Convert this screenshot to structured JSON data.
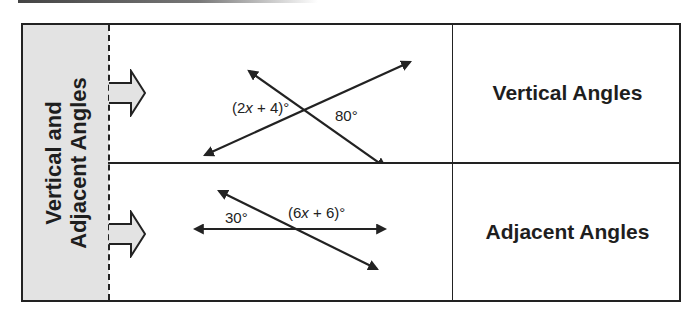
{
  "side_panel": {
    "line1": "Vertical and",
    "line2": "Adjacent Angles",
    "fill": "#e3e3e3"
  },
  "rows": [
    {
      "figure": {
        "left_label": "(2x + 4)°",
        "left_label_parts": [
          "(2",
          "x",
          " + 4)°"
        ],
        "right_label": "80°"
      },
      "term": "Vertical Angles"
    },
    {
      "figure": {
        "left_label": "30°",
        "right_label": "(6x + 6)°",
        "right_label_parts": [
          "(6",
          "x",
          " + 6)°"
        ]
      },
      "term": "Adjacent Angles"
    }
  ],
  "colors": {
    "line": "#222222",
    "background": "#ffffff"
  }
}
